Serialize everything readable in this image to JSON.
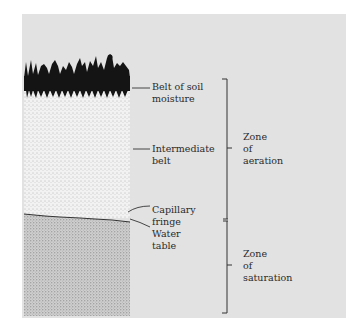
{
  "diagram": {
    "colors": {
      "panel": "#e2e2e2",
      "vegetation": "#141414",
      "aeration_soil": "#f0f0f0",
      "saturation_soil": "#bdbdbd",
      "lines": "#333333"
    },
    "layer_labels": [
      {
        "line1": "Belt of soil",
        "line2": "moisture"
      },
      {
        "line1": "Intermediate",
        "line2": "belt"
      },
      {
        "line1": "Capillary",
        "line2": "fringe"
      },
      {
        "line1": "Water",
        "line2": "table"
      }
    ],
    "zones": [
      {
        "line1": "Zone",
        "line2": "of",
        "line3": "aeration"
      },
      {
        "line1": "Zone",
        "line2": "of",
        "line3": "saturation"
      }
    ]
  }
}
